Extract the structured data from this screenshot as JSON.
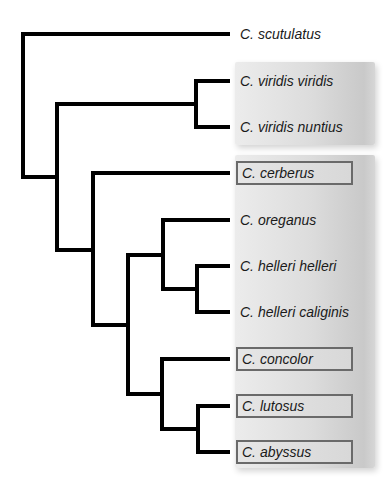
{
  "diagram": {
    "type": "phylogenetic-tree",
    "colors": {
      "branch": "#000000",
      "panel_light": "#ececec",
      "panel_dark": "#c9c9c9",
      "box_border": "#6a6a6a",
      "text": "#1a1a1a"
    },
    "leaves": [
      {
        "label": "C. scutulatus",
        "y": 34,
        "boxed": false,
        "group": "none"
      },
      {
        "label": "C. viridis viridis",
        "y": 81,
        "boxed": false,
        "group": "viridis"
      },
      {
        "label": "C. viridis nuntius",
        "y": 127,
        "boxed": false,
        "group": "viridis"
      },
      {
        "label": "C. cerberus",
        "y": 173,
        "boxed": true,
        "group": "main"
      },
      {
        "label": "C. oreganus",
        "y": 220,
        "boxed": false,
        "group": "main"
      },
      {
        "label": "C. helleri helleri",
        "y": 266,
        "boxed": false,
        "group": "main"
      },
      {
        "label": "C. helleri caliginis",
        "y": 312,
        "boxed": false,
        "group": "main"
      },
      {
        "label": "C. concolor",
        "y": 359,
        "boxed": true,
        "group": "main"
      },
      {
        "label": "C. lutosus",
        "y": 406,
        "boxed": true,
        "group": "main"
      },
      {
        "label": "C. abyssus",
        "y": 452,
        "boxed": true,
        "group": "main"
      }
    ],
    "topology": "(C. scutulatus,((C. viridis viridis,C. viridis nuntius),(C. cerberus,((C. oreganus,(C. helleri helleri,C. helleri caliginis)),(C. concolor,(C. lutosus,C. abyssus))))))"
  }
}
